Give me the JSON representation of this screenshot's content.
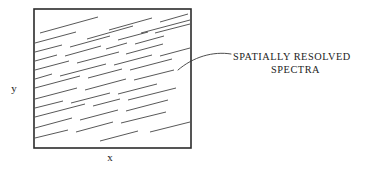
{
  "figure": {
    "background_color": "#ffffff",
    "ink_color": "#2b2b2b",
    "hatch_color": "#3a3a3a"
  },
  "plot_box": {
    "name": "spectra-field",
    "x": 34,
    "y": 9,
    "width": 157,
    "height": 139,
    "border_color": "#2b2b2b",
    "fill_color": "#ffffff"
  },
  "axes": {
    "x_label": "x",
    "y_label": "y",
    "x_label_pos": {
      "x": 110,
      "y": 161
    },
    "y_label_pos": {
      "x": 14,
      "y": 92
    }
  },
  "callout": {
    "line1": "SPATIALLY  RESOLVED",
    "line2": "SPECTRA",
    "line1_pos": {
      "x": 233,
      "y": 60
    },
    "line2_pos": {
      "x": 271,
      "y": 73
    },
    "leader": {
      "start": {
        "x": 178,
        "y": 70
      },
      "control1": {
        "x": 193,
        "y": 57
      },
      "control2": {
        "x": 213,
        "y": 51
      },
      "end": {
        "x": 231,
        "y": 54
      }
    }
  },
  "chart_data": {
    "type": "scatter",
    "title": "",
    "subtitle": "",
    "xlabel": "x",
    "ylabel": "y",
    "xlim": [
      0,
      157
    ],
    "ylim": [
      0,
      139
    ],
    "grid": false,
    "legend": null,
    "annotations": [
      {
        "text": "SPATIALLY  RESOLVED SPECTRA",
        "points_to": {
          "x": 144,
          "y": 78
        }
      }
    ],
    "streak_angle_deg": -15,
    "streak_count": 34,
    "streaks": [
      {
        "x1": 40,
        "y1": 33,
        "x2": 98,
        "y2": 17
      },
      {
        "x1": 109,
        "y1": 30,
        "x2": 152,
        "y2": 18
      },
      {
        "x1": 160,
        "y1": 22,
        "x2": 188,
        "y2": 14
      },
      {
        "x1": 35,
        "y1": 43,
        "x2": 76,
        "y2": 32
      },
      {
        "x1": 87,
        "y1": 39,
        "x2": 133,
        "y2": 26
      },
      {
        "x1": 141,
        "y1": 33,
        "x2": 190,
        "y2": 20
      },
      {
        "x1": 35,
        "y1": 52,
        "x2": 62,
        "y2": 45
      },
      {
        "x1": 70,
        "y1": 47,
        "x2": 110,
        "y2": 36
      },
      {
        "x1": 118,
        "y1": 40,
        "x2": 148,
        "y2": 32
      },
      {
        "x1": 155,
        "y1": 33,
        "x2": 190,
        "y2": 24
      },
      {
        "x1": 35,
        "y1": 61,
        "x2": 57,
        "y2": 55
      },
      {
        "x1": 65,
        "y1": 56,
        "x2": 101,
        "y2": 46
      },
      {
        "x1": 106,
        "y1": 49,
        "x2": 127,
        "y2": 43
      },
      {
        "x1": 135,
        "y1": 44,
        "x2": 164,
        "y2": 36
      },
      {
        "x1": 35,
        "y1": 70,
        "x2": 69,
        "y2": 61
      },
      {
        "x1": 77,
        "y1": 63,
        "x2": 119,
        "y2": 52
      },
      {
        "x1": 126,
        "y1": 54,
        "x2": 163,
        "y2": 44
      },
      {
        "x1": 35,
        "y1": 79,
        "x2": 52,
        "y2": 74
      },
      {
        "x1": 60,
        "y1": 76,
        "x2": 106,
        "y2": 64
      },
      {
        "x1": 114,
        "y1": 65,
        "x2": 152,
        "y2": 55
      },
      {
        "x1": 160,
        "y1": 56,
        "x2": 190,
        "y2": 48
      },
      {
        "x1": 35,
        "y1": 88,
        "x2": 80,
        "y2": 76
      },
      {
        "x1": 88,
        "y1": 78,
        "x2": 122,
        "y2": 69
      },
      {
        "x1": 130,
        "y1": 70,
        "x2": 172,
        "y2": 59
      },
      {
        "x1": 35,
        "y1": 99,
        "x2": 77,
        "y2": 88
      },
      {
        "x1": 85,
        "y1": 90,
        "x2": 126,
        "y2": 79
      },
      {
        "x1": 134,
        "y1": 80,
        "x2": 174,
        "y2": 70
      },
      {
        "x1": 35,
        "y1": 108,
        "x2": 63,
        "y2": 101
      },
      {
        "x1": 71,
        "y1": 103,
        "x2": 110,
        "y2": 93
      },
      {
        "x1": 118,
        "y1": 94,
        "x2": 157,
        "y2": 84
      },
      {
        "x1": 35,
        "y1": 117,
        "x2": 85,
        "y2": 104
      },
      {
        "x1": 93,
        "y1": 106,
        "x2": 120,
        "y2": 99
      },
      {
        "x1": 128,
        "y1": 100,
        "x2": 176,
        "y2": 88
      },
      {
        "x1": 35,
        "y1": 128,
        "x2": 72,
        "y2": 118
      },
      {
        "x1": 80,
        "y1": 120,
        "x2": 118,
        "y2": 110
      },
      {
        "x1": 126,
        "y1": 111,
        "x2": 168,
        "y2": 100
      },
      {
        "x1": 35,
        "y1": 138,
        "x2": 68,
        "y2": 130
      },
      {
        "x1": 76,
        "y1": 132,
        "x2": 113,
        "y2": 122
      },
      {
        "x1": 121,
        "y1": 123,
        "x2": 166,
        "y2": 112
      },
      {
        "x1": 150,
        "y1": 132,
        "x2": 190,
        "y2": 122
      },
      {
        "x1": 100,
        "y1": 141,
        "x2": 138,
        "y2": 131
      }
    ]
  }
}
